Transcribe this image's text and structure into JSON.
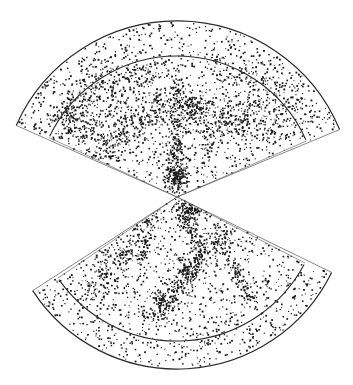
{
  "figure": {
    "caption_fragment": "",
    "colors": {
      "background": "#ffffff",
      "ink": "#1a1a1a",
      "boundary": "#2a2a2a",
      "edge_light": "#555555"
    },
    "apex": {
      "x": 177,
      "y": 197
    },
    "wedges": [
      {
        "name": "north-wedge",
        "direction": "up",
        "left_angle_deg": 204,
        "right_angle_deg": 337.5,
        "outer_radius": 176,
        "inner_radius": 141,
        "double_edge": true,
        "seed": 11,
        "background_points": 1500,
        "filaments": [
          {
            "x1": 177,
            "y1": 197,
            "x2": 177,
            "y2": 80,
            "n": 260,
            "spread": 4
          },
          {
            "x1": 60,
            "y1": 110,
            "x2": 300,
            "y2": 120,
            "n": 380,
            "spread": 10
          },
          {
            "x1": 80,
            "y1": 90,
            "x2": 160,
            "y2": 70,
            "n": 160,
            "spread": 9
          },
          {
            "x1": 150,
            "y1": 110,
            "x2": 100,
            "y2": 160,
            "n": 120,
            "spread": 6
          },
          {
            "x1": 200,
            "y1": 150,
            "x2": 260,
            "y2": 100,
            "n": 140,
            "spread": 7
          },
          {
            "x1": 120,
            "y1": 140,
            "x2": 60,
            "y2": 130,
            "n": 90,
            "spread": 6
          },
          {
            "x1": 220,
            "y1": 70,
            "x2": 300,
            "y2": 90,
            "n": 110,
            "spread": 8
          }
        ],
        "clusters": [
          {
            "x": 177,
            "y": 175,
            "n": 120,
            "r": 6
          },
          {
            "x": 193,
            "y": 106,
            "n": 70,
            "r": 5
          },
          {
            "x": 70,
            "y": 115,
            "n": 50,
            "r": 6
          },
          {
            "x": 160,
            "y": 100,
            "n": 40,
            "r": 5
          }
        ]
      },
      {
        "name": "south-wedge",
        "direction": "down",
        "left_angle_deg": 147,
        "right_angle_deg": 26,
        "outer_radius": 172,
        "inner_radius": 144,
        "double_edge": true,
        "seed": 29,
        "background_points": 1200,
        "filaments": [
          {
            "x1": 177,
            "y1": 200,
            "x2": 200,
            "y2": 250,
            "n": 150,
            "spread": 5
          },
          {
            "x1": 230,
            "y1": 230,
            "x2": 150,
            "y2": 320,
            "n": 320,
            "spread": 6
          },
          {
            "x1": 120,
            "y1": 250,
            "x2": 90,
            "y2": 300,
            "n": 110,
            "spread": 8
          },
          {
            "x1": 230,
            "y1": 260,
            "x2": 250,
            "y2": 300,
            "n": 70,
            "spread": 3
          },
          {
            "x1": 150,
            "y1": 210,
            "x2": 140,
            "y2": 260,
            "n": 90,
            "spread": 6
          }
        ],
        "clusters": [
          {
            "x": 192,
            "y": 211,
            "n": 90,
            "r": 5
          },
          {
            "x": 185,
            "y": 270,
            "n": 70,
            "r": 6
          },
          {
            "x": 128,
            "y": 255,
            "n": 40,
            "r": 5
          },
          {
            "x": 160,
            "y": 300,
            "n": 40,
            "r": 5
          }
        ]
      }
    ]
  }
}
